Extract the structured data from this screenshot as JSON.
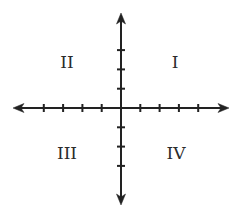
{
  "diagram": {
    "colors": {
      "axis": "#222222",
      "label": "#2b2b2b",
      "background": "#ffffff"
    },
    "origin": {
      "x": 121,
      "y": 108
    },
    "tick_spacing": 19.3,
    "x_ticks_each_side": 4,
    "y_ticks_each_side": 3,
    "axis_extent": {
      "left": 13,
      "right": 229,
      "top": 13,
      "bottom": 205
    },
    "quadrants": [
      {
        "id": "q1",
        "label": "I",
        "x": 175,
        "y": 62
      },
      {
        "id": "q2",
        "label": "II",
        "x": 67,
        "y": 62
      },
      {
        "id": "q3",
        "label": "III",
        "x": 67,
        "y": 153
      },
      {
        "id": "q4",
        "label": "IV",
        "x": 176,
        "y": 153
      }
    ]
  }
}
